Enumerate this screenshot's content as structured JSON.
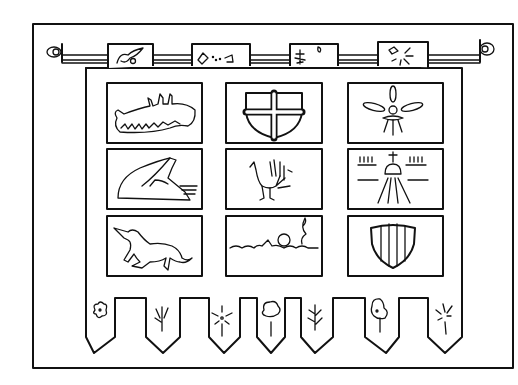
{
  "image": {
    "title": "Heraldic banner with nine emblem panels",
    "panels": [
      {
        "row": 1,
        "col": 1,
        "emblem": "dragon"
      },
      {
        "row": 1,
        "col": 2,
        "emblem": "shield-with-cross"
      },
      {
        "row": 1,
        "col": 3,
        "emblem": "fleur-de-lis"
      },
      {
        "row": 2,
        "col": 1,
        "emblem": "winged-horse-wing"
      },
      {
        "row": 2,
        "col": 2,
        "emblem": "peacock"
      },
      {
        "row": 2,
        "col": 3,
        "emblem": "domed-building-with-rays"
      },
      {
        "row": 3,
        "col": 1,
        "emblem": "unicorn"
      },
      {
        "row": 3,
        "col": 2,
        "emblem": "swimmer-in-waves"
      },
      {
        "row": 3,
        "col": 3,
        "emblem": "striped-shield"
      }
    ],
    "top_tabs": [
      "bird",
      "kite",
      "tree",
      "sun"
    ],
    "bottom_tabs": [
      "flower",
      "sprout",
      "starburst",
      "tree",
      "pine",
      "tree",
      "starburst"
    ]
  }
}
